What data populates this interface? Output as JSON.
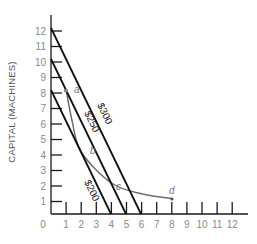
{
  "chart_data": {
    "type": "line",
    "title": "",
    "xlabel": "",
    "ylabel": "CAPITAL (MACHINES)",
    "xlim": [
      0,
      13
    ],
    "ylim": [
      0,
      13
    ],
    "x_ticks": [
      "0",
      "1",
      "2",
      "3",
      "4",
      "5",
      "6",
      "7",
      "8",
      "9",
      "10",
      "11",
      "12"
    ],
    "y_ticks": [
      "1",
      "2",
      "3",
      "4",
      "5",
      "6",
      "7",
      "8",
      "9",
      "10",
      "11",
      "12"
    ],
    "grid": false,
    "legend": null,
    "series": [
      {
        "name": "$200",
        "kind": "isocost",
        "points": [
          [
            0,
            8
          ],
          [
            4,
            0
          ]
        ],
        "color": "#1a1a1a"
      },
      {
        "name": "$250",
        "kind": "isocost",
        "points": [
          [
            0,
            10
          ],
          [
            5,
            0
          ]
        ],
        "color": "#1a1a1a"
      },
      {
        "name": "$300",
        "kind": "isocost",
        "points": [
          [
            0,
            12
          ],
          [
            6,
            0
          ]
        ],
        "color": "#1a1a1a"
      },
      {
        "name": "isoquant",
        "kind": "curve",
        "points": [
          [
            1,
            8
          ],
          [
            1.4,
            6
          ],
          [
            2,
            4
          ],
          [
            4,
            2
          ],
          [
            6,
            1.3
          ],
          [
            8,
            1
          ]
        ],
        "color": "#666666"
      }
    ],
    "annotations": [
      {
        "text": "a",
        "x": 1,
        "y": 8
      },
      {
        "text": "b",
        "x": 2,
        "y": 4
      },
      {
        "text": "c",
        "x": 4,
        "y": 2
      },
      {
        "text": "d",
        "x": 8,
        "y": 1
      },
      {
        "text": "$200",
        "on": "isocost $200"
      },
      {
        "text": "$250",
        "on": "isocost $250"
      },
      {
        "text": "$300",
        "on": "isocost $300"
      }
    ]
  },
  "labels": {
    "y_axis_title": "CAPITAL (MACHINES)",
    "line_200": "$200",
    "line_250": "$250",
    "line_300": "$300",
    "point_a": "a",
    "point_b": "b",
    "point_c": "c",
    "point_d": "d",
    "x_ticks": [
      "0",
      "1",
      "2",
      "3",
      "4",
      "5",
      "6",
      "7",
      "8",
      "9",
      "10",
      "11",
      "12"
    ],
    "y_ticks": [
      "1",
      "2",
      "3",
      "4",
      "5",
      "6",
      "7",
      "8",
      "9",
      "10",
      "11",
      "12"
    ]
  }
}
